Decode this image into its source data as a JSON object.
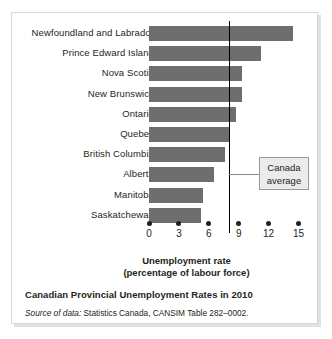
{
  "figure": {
    "caption": "Canadian Provincial Unemployment Rates in 2010",
    "source_lead": "Source of data:",
    "source_rest": " Statistics Canada, CANSIM Table 282–0002."
  },
  "annotation": {
    "line1": "Canada",
    "line2": "average"
  },
  "axis": {
    "title_line1": "Unemployment rate",
    "title_line2": "(percentage of labour force)",
    "ticks": [
      "0",
      "3",
      "6",
      "9",
      "12",
      "15"
    ]
  },
  "colors": {
    "bar": "#6e6e6e",
    "avg_line": "#000000",
    "text": "#231f20",
    "frame": "#d9d9d9",
    "box_fill": "#ebebeb"
  },
  "chart_data": {
    "type": "bar",
    "orientation": "horizontal",
    "title": "Canadian Provincial Unemployment Rates in 2010",
    "subtitle": "",
    "xlabel": "Unemployment rate (percentage of labour force)",
    "ylabel": "",
    "xlim": [
      0,
      15
    ],
    "xticks": [
      0,
      3,
      6,
      9,
      12,
      15
    ],
    "grid": false,
    "legend_position": "none",
    "categories": [
      "Newfoundland and Labrador",
      "Prince Edward Island",
      "Nova Scotia",
      "New Brunswick",
      "Ontario",
      "Quebec",
      "British Columbia",
      "Alberta",
      "Manitoba",
      "Saskatchewan"
    ],
    "values": [
      14.4,
      11.2,
      9.3,
      9.3,
      8.7,
      8.0,
      7.6,
      6.5,
      5.4,
      5.2
    ],
    "annotations": [
      {
        "label": "Canada average",
        "type": "reference-line",
        "value": 8.0
      }
    ]
  }
}
